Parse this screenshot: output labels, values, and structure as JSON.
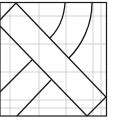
{
  "diagram": {
    "colors": {
      "background": "#ffffff",
      "grid": "#c8c8c8",
      "stroke": "#1a1a1a"
    },
    "grid": {
      "vertical_x": [
        10,
        39,
        66,
        93,
        101
      ],
      "horizontal_y": [
        16,
        44,
        72,
        100,
        108
      ]
    },
    "border": {
      "x": 0,
      "y": 2,
      "width": 107,
      "height": 114
    }
  }
}
